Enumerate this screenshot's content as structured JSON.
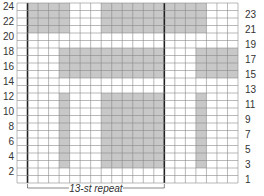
{
  "chart_data": {
    "type": "heatmap",
    "title": "",
    "columns": 21,
    "rows": 24,
    "row_numbering": "bottom-to-top",
    "left_row_labels": [
      2,
      4,
      6,
      8,
      10,
      12,
      14,
      16,
      18,
      20,
      22,
      24
    ],
    "right_row_labels": [
      1,
      3,
      5,
      7,
      9,
      11,
      13,
      15,
      17,
      19,
      21,
      23
    ],
    "repeat": {
      "label": "13-st repeat",
      "start_col": 2,
      "end_col": 14
    },
    "thick_lines_after_cols": [
      1,
      14
    ],
    "colors": {
      "shaded": "#c8c8c8",
      "empty": "#ffffff",
      "grid": "#8a8a8a",
      "thick": "#222222"
    },
    "shaded_blocks": [
      {
        "rows": [
          21,
          24
        ],
        "cols": [
          2,
          5
        ]
      },
      {
        "rows": [
          21,
          24
        ],
        "cols": [
          9,
          18
        ]
      },
      {
        "rows": [
          15,
          18
        ],
        "cols": [
          5,
          14
        ]
      },
      {
        "rows": [
          15,
          18
        ],
        "cols": [
          18,
          21
        ]
      },
      {
        "rows": [
          3,
          12
        ],
        "cols": [
          5,
          5
        ]
      },
      {
        "rows": [
          3,
          12
        ],
        "cols": [
          9,
          14
        ]
      },
      {
        "rows": [
          3,
          12
        ],
        "cols": [
          18,
          18
        ]
      }
    ]
  },
  "repeat_label": "13-st repeat"
}
